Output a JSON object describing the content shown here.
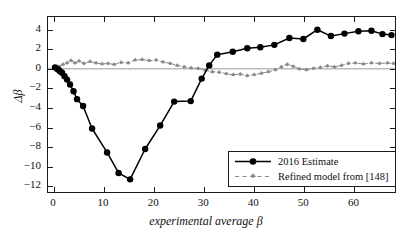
{
  "figure": {
    "background": "#ffffff",
    "frame_color": "#1a1a1a"
  },
  "axes": {
    "xlabel": "experimental average β",
    "ylabel": "Δβ",
    "xticks": [
      "0",
      "10",
      "20",
      "30",
      "40",
      "50",
      "60"
    ],
    "yticks": [
      "4",
      "2",
      "0",
      "−2",
      "−4",
      "−6",
      "−8",
      "−10",
      "−12"
    ]
  },
  "legend": {
    "items": [
      {
        "label": "2016 Estimate",
        "marker": "filled-circle",
        "line": "solid",
        "color": "#000000"
      },
      {
        "label": "Refined model from [148]",
        "marker": "small-marker",
        "line": "dashed",
        "color": "#8a8a8a"
      }
    ]
  },
  "chart_data": {
    "type": "line",
    "title": "",
    "xlabel": "experimental average β",
    "ylabel": "Δβ",
    "xlim": [
      -1.2,
      68.5
    ],
    "ylim": [
      -12.8,
      5.3
    ],
    "xticks": [
      0,
      10,
      20,
      30,
      40,
      50,
      60
    ],
    "yticks": [
      -12,
      -10,
      -8,
      -6,
      -4,
      -2,
      0,
      2,
      4
    ],
    "grid": false,
    "legend_position": "lower right",
    "zero_line": 0,
    "series": [
      {
        "name": "2016 Estimate",
        "style": "solid",
        "marker": "filled-circle",
        "color": "#000000",
        "points": [
          [
            0.2,
            0.15
          ],
          [
            0.6,
            0.0
          ],
          [
            0.9,
            -0.1
          ],
          [
            1.2,
            -0.25
          ],
          [
            1.6,
            -0.4
          ],
          [
            2.1,
            -0.75
          ],
          [
            2.6,
            -1.1
          ],
          [
            3.2,
            -1.6
          ],
          [
            3.9,
            -2.3
          ],
          [
            4.6,
            -3.1
          ],
          [
            5.8,
            -3.8
          ],
          [
            7.6,
            -6.1
          ],
          [
            10.6,
            -8.55
          ],
          [
            12.9,
            -10.65
          ],
          [
            15.2,
            -11.3
          ],
          [
            18.2,
            -8.2
          ],
          [
            21.2,
            -5.8
          ],
          [
            24.0,
            -3.35
          ],
          [
            27.3,
            -3.3
          ],
          [
            29.5,
            -1.0
          ],
          [
            31.0,
            0.35
          ],
          [
            32.6,
            1.45
          ],
          [
            35.7,
            1.75
          ],
          [
            38.6,
            2.1
          ],
          [
            41.2,
            2.2
          ],
          [
            44.0,
            2.45
          ],
          [
            47.0,
            3.15
          ],
          [
            49.8,
            3.05
          ],
          [
            52.6,
            4.0
          ],
          [
            55.3,
            3.35
          ],
          [
            58.0,
            3.6
          ],
          [
            60.8,
            3.85
          ],
          [
            63.4,
            3.9
          ],
          [
            65.6,
            3.55
          ],
          [
            67.4,
            3.45
          ]
        ]
      },
      {
        "name": "Refined model from [148]",
        "style": "dashed",
        "marker": "small-marker",
        "color": "#8a8a8a",
        "points": [
          [
            0.3,
            0.1
          ],
          [
            1.0,
            0.25
          ],
          [
            1.8,
            0.45
          ],
          [
            2.6,
            0.6
          ],
          [
            3.4,
            0.85
          ],
          [
            4.2,
            0.6
          ],
          [
            5.0,
            0.8
          ],
          [
            6.0,
            0.55
          ],
          [
            7.2,
            0.75
          ],
          [
            8.4,
            0.6
          ],
          [
            9.6,
            0.5
          ],
          [
            10.8,
            0.55
          ],
          [
            12.0,
            0.45
          ],
          [
            13.4,
            0.65
          ],
          [
            14.8,
            0.6
          ],
          [
            16.2,
            0.9
          ],
          [
            17.6,
            0.95
          ],
          [
            19.0,
            0.85
          ],
          [
            20.4,
            0.9
          ],
          [
            21.8,
            0.7
          ],
          [
            23.2,
            0.55
          ],
          [
            24.6,
            0.35
          ],
          [
            26.0,
            0.2
          ],
          [
            27.4,
            0.1
          ],
          [
            28.8,
            0.05
          ],
          [
            30.2,
            -0.15
          ],
          [
            31.6,
            -0.3
          ],
          [
            33.0,
            -0.35
          ],
          [
            34.4,
            -0.5
          ],
          [
            35.8,
            -0.6
          ],
          [
            37.2,
            -0.55
          ],
          [
            38.6,
            -0.7
          ],
          [
            40.0,
            -0.6
          ],
          [
            41.4,
            -0.45
          ],
          [
            42.8,
            -0.3
          ],
          [
            44.2,
            -0.1
          ],
          [
            45.4,
            0.2
          ],
          [
            46.6,
            0.45
          ],
          [
            47.8,
            0.25
          ],
          [
            49.0,
            0.0
          ],
          [
            50.4,
            -0.1
          ],
          [
            51.8,
            0.05
          ],
          [
            53.2,
            0.15
          ],
          [
            54.6,
            0.3
          ],
          [
            56.0,
            0.2
          ],
          [
            57.4,
            0.35
          ],
          [
            58.8,
            0.55
          ],
          [
            60.2,
            0.6
          ],
          [
            61.8,
            0.5
          ],
          [
            63.4,
            0.6
          ],
          [
            65.0,
            0.55
          ],
          [
            66.6,
            0.6
          ],
          [
            67.8,
            0.55
          ]
        ]
      }
    ]
  }
}
